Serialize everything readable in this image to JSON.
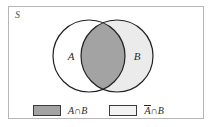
{
  "figure": {
    "type": "venn-diagram",
    "universe_label": "S",
    "set_a_label": "A",
    "set_b_label": "B",
    "background_color": "#ffffff",
    "frame_color": "#b6b6b6",
    "outline_color": "#222222",
    "region_colors": {
      "a_only": "#ffffff",
      "b_only": "#ebebeb",
      "intersection": "#a3a3a3",
      "outside": "#ffffff"
    }
  },
  "legend": {
    "entries": [
      {
        "swatch": "dark-gray-swatch",
        "label_set": "A",
        "label_complement": false,
        "operator": "∩",
        "label_second": "B",
        "full_label": "A∩B",
        "color": "#a3a3a3"
      },
      {
        "swatch": "light-gray-swatch",
        "label_set": "A",
        "label_complement": true,
        "operator": "∩",
        "label_second": "B",
        "full_label": "Ā∩B",
        "color": "#f2f2f2"
      }
    ]
  }
}
